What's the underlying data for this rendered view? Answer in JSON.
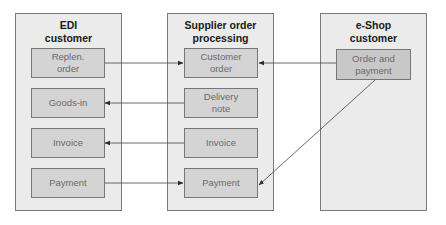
{
  "columns": [
    {
      "title": "EDI\ncustomer",
      "title_lines": [
        "EDI",
        "customer"
      ],
      "boxes": [
        {
          "label_lines": [
            "Replen.",
            "order"
          ]
        },
        {
          "label_lines": [
            "Goods-in"
          ]
        },
        {
          "label_lines": [
            "Invoice"
          ]
        },
        {
          "label_lines": [
            "Payment"
          ]
        }
      ]
    },
    {
      "title_lines": [
        "Supplier order",
        "processing"
      ],
      "boxes": [
        {
          "label_lines": [
            "Customer",
            "order"
          ]
        },
        {
          "label_lines": [
            "Delivery",
            "note"
          ]
        },
        {
          "label_lines": [
            "Invoice"
          ]
        },
        {
          "label_lines": [
            "Payment"
          ]
        }
      ]
    },
    {
      "title_lines": [
        "e-Shop",
        "customer"
      ],
      "boxes": [
        {
          "label_lines": [
            "Order and",
            "payment"
          ]
        }
      ]
    }
  ],
  "arrows": [
    {
      "from": "EDI: Replen. order",
      "to": "Supplier: Customer order"
    },
    {
      "from": "Supplier: Delivery note",
      "to": "EDI: Goods-in"
    },
    {
      "from": "Supplier: Invoice",
      "to": "EDI: Invoice"
    },
    {
      "from": "EDI: Payment",
      "to": "Supplier: Payment"
    },
    {
      "from": "e-Shop: Order and payment",
      "to": "Supplier: Customer order"
    },
    {
      "from": "e-Shop: Order and payment",
      "to": "Supplier: Payment"
    }
  ],
  "colors": {
    "column_bg": "#ebebeb",
    "box_bg": "#d4d4d4",
    "border": "#777777",
    "title_text": "#1a1a1a",
    "box_text": "#6a6a6a"
  }
}
